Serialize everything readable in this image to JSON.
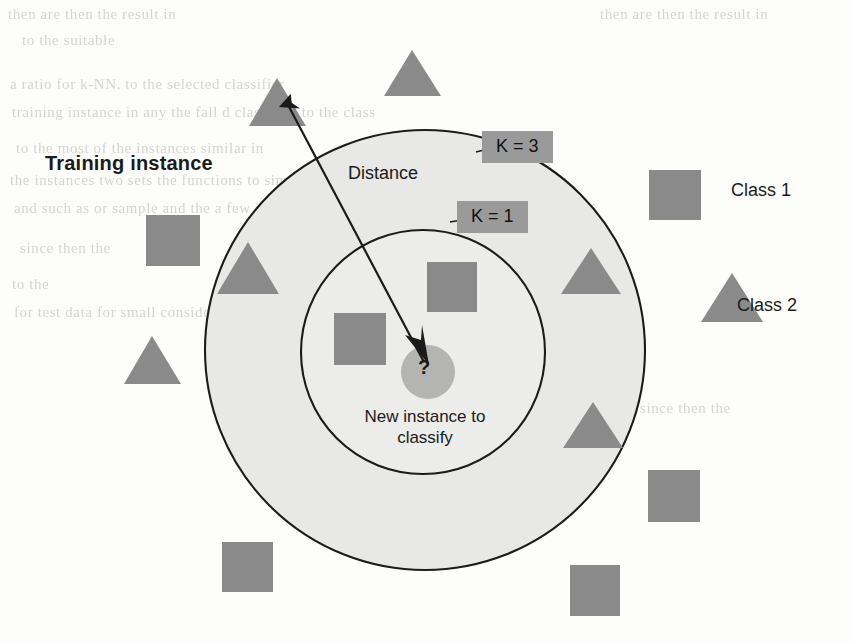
{
  "figure": {
    "type": "knn-classification-diagram",
    "training_instance_label": "Training instance",
    "distance_label": "Distance",
    "k3_label": "K = 3",
    "k1_label": "K = 1",
    "query_marker": "?",
    "new_instance_label": "New instance to classify",
    "legend": {
      "class1": "Class 1",
      "class2": "Class 2"
    },
    "colors": {
      "shape_gray": "#8a8a8a",
      "circle_fill": "#e8e8e6",
      "inner_circle_fill": "#ececea",
      "label_box_gray": "#9a9a9a",
      "outline": "#1b1b1b",
      "query_circle": "#b4b4b2",
      "page_background": "#fdfdfc"
    }
  },
  "background_text": {
    "note": "faint scanned bleed-through text from reverse of page (illegible)",
    "lines": [
      "then are                          then the   result in",
      "to  the                 suitable",
      "a                  ratio  for    k-NN.             to the  selected  classifier",
      "training  instance  in   any   the  fall     d  classified  to  the  class",
      "to  the   most    of  the     instances  similar                 in",
      "the  instances  two  sets  the                 functions  to   similar  to   general",
      "and  such  as   or  sample   and   the                                            a  few  in",
      "since     then  the",
      "to                                                                    the",
      "for  test  data   for  small                     considerably      value  rates of"
    ]
  }
}
